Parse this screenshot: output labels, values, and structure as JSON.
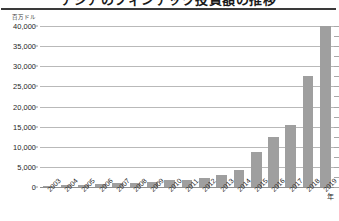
{
  "chart": {
    "title": "アジアのフィンテック投資額の推移",
    "unit_label": "百万ドル",
    "x_unit_label": "年"
  },
  "chart_data": {
    "type": "bar",
    "title": "アジアのフィンテック投資額の推移",
    "xlabel": "年",
    "ylabel": "百万ドル",
    "ylim": [
      0,
      40000
    ],
    "ytick_labels": [
      "40,000",
      "35,000",
      "30,000",
      "25,000",
      "20,000",
      "15,000",
      "10,000",
      "5,000",
      "0"
    ],
    "ytick_values": [
      40000,
      35000,
      30000,
      25000,
      20000,
      15000,
      10000,
      5000,
      0
    ],
    "grid": true,
    "legend": "none",
    "bar_color": "#9f9f9f",
    "categories": [
      "2003",
      "2004",
      "2005",
      "2006",
      "2007",
      "2008",
      "2009",
      "2010",
      "2011",
      "2012",
      "2013",
      "2014",
      "2015",
      "2016",
      "2017",
      "2018",
      "2019"
    ],
    "values": [
      200,
      400,
      600,
      700,
      900,
      1100,
      1300,
      1800,
      1700,
      2300,
      3000,
      4200,
      8700,
      12500,
      15500,
      27500,
      40000
    ]
  }
}
